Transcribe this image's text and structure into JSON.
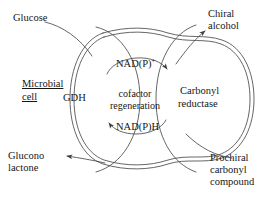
{
  "figure": {
    "type": "biochemical-pathway-diagram",
    "background_color": "#ffffff",
    "line_color": "#4a4a4a",
    "text_color": "#161616"
  },
  "labels": {
    "substrate_in": "Glucose",
    "product_out_left": "Glucono\nlactone",
    "product_out_right": "Chiral\nalcohol",
    "substrate_in_right": "Prochiral\ncarbonyl\ncompound",
    "cell_name_line1": "Microbial",
    "cell_name_line2": "cell",
    "enzyme_left": "GDH",
    "enzyme_right_line1": "Carbonyl",
    "enzyme_right_line2": "reductase",
    "cycle_line1": "cofactor",
    "cycle_line2": "regeneration",
    "cofactor_oxidized": "NAD(P)",
    "cofactor_oxidized_charge": "+",
    "cofactor_reduced": "NAD(P)H"
  },
  "arrows": [
    {
      "name": "glucose-into-cell",
      "label": "Glucose",
      "direction": "down-right",
      "head": false
    },
    {
      "name": "glucono-lactone-out",
      "label": "Glucono lactone",
      "direction": "left",
      "head": true
    },
    {
      "name": "chiral-alcohol-out",
      "label": "Chiral alcohol",
      "direction": "up-right",
      "head": true
    },
    {
      "name": "prochiral-carbonyl-in",
      "label": "Prochiral carbonyl compound",
      "direction": "up-left",
      "head": false
    },
    {
      "name": "cofactor-cycle-oxidized",
      "label": "NAD(P)+",
      "direction": "clockwise-up",
      "head": true
    },
    {
      "name": "cofactor-cycle-reduced",
      "label": "NAD(P)H",
      "direction": "counterclockwise-down",
      "head": true
    }
  ]
}
